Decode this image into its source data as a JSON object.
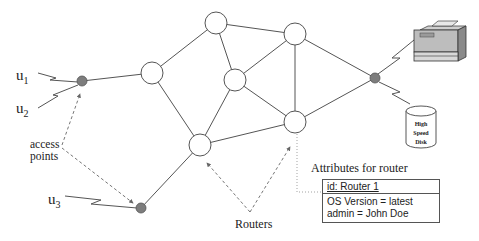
{
  "users": [
    {
      "label": "u",
      "sub": "1"
    },
    {
      "label": "u",
      "sub": "2"
    },
    {
      "label": "u",
      "sub": "3"
    }
  ],
  "labels": {
    "access_points_line1": "access",
    "access_points_line2": "points",
    "routers": "Routers",
    "attributes_title": "Attributes for router"
  },
  "attribute_box": {
    "id_line": "id: Router 1",
    "attributes": [
      "OS Version = latest",
      "admin = John Doe"
    ]
  },
  "disk": {
    "line1": "High",
    "line2": "Speed",
    "line3": "Disk"
  },
  "colors": {
    "access_point_fill": "#7d7d7d",
    "router_fill": "#ffffff",
    "line": "#555555"
  }
}
